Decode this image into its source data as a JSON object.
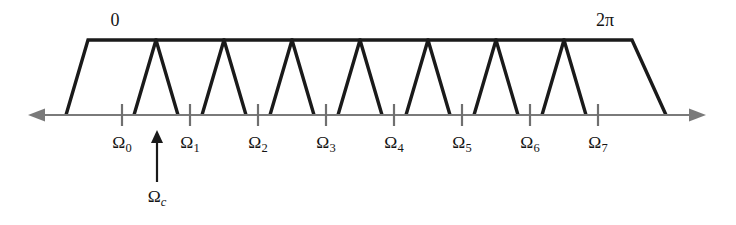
{
  "figure": {
    "background_color": "#ffffff",
    "band_stroke_color": "#1a1a1a",
    "axis_color": "#7a7a7a",
    "tick_color": "#6f6f6f",
    "cursor_color": "#1a1a1a"
  },
  "annotations": {
    "origin_label": "0",
    "period_label": "2π",
    "cursor_label_base": "Ω",
    "cursor_label_sub": "c"
  },
  "axis": {
    "baseline_y": 115,
    "x_start": 28,
    "x_end": 706,
    "left_arrow": true,
    "right_arrow": true,
    "tick_height": 11,
    "tick_spacing": 68
  },
  "ticks": [
    {
      "id": "tick-0",
      "x": 122,
      "base": "Ω",
      "sub": "0"
    },
    {
      "id": "tick-1",
      "x": 190,
      "base": "Ω",
      "sub": "1"
    },
    {
      "id": "tick-2",
      "x": 258,
      "base": "Ω",
      "sub": "2"
    },
    {
      "id": "tick-3",
      "x": 326,
      "base": "Ω",
      "sub": "3"
    },
    {
      "id": "tick-4",
      "x": 394,
      "base": "Ω",
      "sub": "4"
    },
    {
      "id": "tick-5",
      "x": 462,
      "base": "Ω",
      "sub": "5"
    },
    {
      "id": "tick-6",
      "x": 530,
      "base": "Ω",
      "sub": "6"
    },
    {
      "id": "tick-7",
      "x": 598,
      "base": "Ω",
      "sub": "7"
    }
  ],
  "bands": [
    {
      "id": "band-0",
      "bottom_left": 66,
      "top_left": 88,
      "top_right": 156,
      "bottom_right": 178
    },
    {
      "id": "band-1",
      "bottom_left": 134,
      "top_left": 156,
      "top_right": 224,
      "bottom_right": 246
    },
    {
      "id": "band-2",
      "bottom_left": 202,
      "top_left": 224,
      "top_right": 292,
      "bottom_right": 314
    },
    {
      "id": "band-3",
      "bottom_left": 270,
      "top_left": 292,
      "top_right": 360,
      "bottom_right": 382
    },
    {
      "id": "band-4",
      "bottom_left": 338,
      "top_left": 360,
      "top_right": 428,
      "bottom_right": 450
    },
    {
      "id": "band-5",
      "bottom_left": 406,
      "top_left": 428,
      "top_right": 496,
      "bottom_right": 518
    },
    {
      "id": "band-6",
      "bottom_left": 474,
      "top_left": 496,
      "top_right": 564,
      "bottom_right": 586
    },
    {
      "id": "band-7",
      "bottom_left": 542,
      "top_left": 564,
      "top_right": 632,
      "bottom_right": 666
    }
  ],
  "band_geometry": {
    "top_y": 40,
    "bottom_y": 115
  },
  "cursor": {
    "x": 157,
    "arrow_tip_y": 130,
    "shaft_bottom_y": 182,
    "label_y": 202
  },
  "top_labels": [
    {
      "id": "label-origin",
      "text": "0",
      "x": 115,
      "y": 26
    },
    {
      "id": "label-period",
      "text": "2π",
      "x": 605,
      "y": 26
    }
  ],
  "chart_data": {
    "type": "line",
    "xlabel": "Ω (frequency)",
    "ylabel": "Magnitude",
    "grid": false,
    "legend": "none",
    "axis_markers": [
      "0",
      "2π"
    ],
    "categories": [
      "Ω0",
      "Ω1",
      "Ω2",
      "Ω3",
      "Ω4",
      "Ω5",
      "Ω6",
      "Ω7"
    ],
    "band_count": 8,
    "passband_level": 1,
    "stopband_level": 0,
    "cursor_frequency_label": "Ωc",
    "series": [
      {
        "name": "Band 0",
        "x": [
          66,
          88,
          156,
          178
        ],
        "values": [
          0,
          1,
          1,
          0
        ]
      },
      {
        "name": "Band 1",
        "x": [
          134,
          156,
          224,
          246
        ],
        "values": [
          0,
          1,
          1,
          0
        ]
      },
      {
        "name": "Band 2",
        "x": [
          202,
          224,
          292,
          314
        ],
        "values": [
          0,
          1,
          1,
          0
        ]
      },
      {
        "name": "Band 3",
        "x": [
          270,
          292,
          360,
          382
        ],
        "values": [
          0,
          1,
          1,
          0
        ]
      },
      {
        "name": "Band 4",
        "x": [
          338,
          360,
          428,
          450
        ],
        "values": [
          0,
          1,
          1,
          0
        ]
      },
      {
        "name": "Band 5",
        "x": [
          406,
          428,
          496,
          518
        ],
        "values": [
          0,
          1,
          1,
          0
        ]
      },
      {
        "name": "Band 6",
        "x": [
          474,
          496,
          564,
          586
        ],
        "values": [
          0,
          1,
          1,
          0
        ]
      },
      {
        "name": "Band 7",
        "x": [
          542,
          564,
          632,
          666
        ],
        "values": [
          0,
          1,
          1,
          0
        ]
      }
    ]
  }
}
